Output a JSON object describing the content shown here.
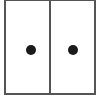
{
  "icon": {
    "name": "double-door-cabinet",
    "doors": [
      {
        "id": "left",
        "knob": true
      },
      {
        "id": "right",
        "knob": true
      }
    ],
    "colors": {
      "outline": "#555555",
      "knob": "#1a1a1a",
      "background": "#ffffff"
    }
  }
}
